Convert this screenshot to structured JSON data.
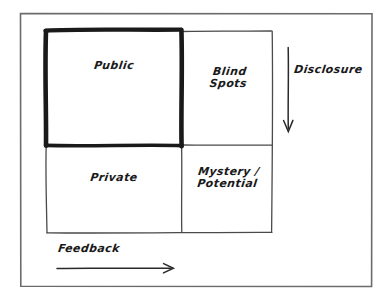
{
  "diagram": {
    "style": "hand-drawn sketch",
    "background_color": "#ffffff",
    "ink_color": "#1a1a1a",
    "frame_color": "#6b6b6b",
    "quadrants": [
      {
        "id": "public",
        "label": "Public",
        "row": "top",
        "col": "left",
        "emphasis": "bold-border"
      },
      {
        "id": "blind",
        "label": "Blind\nSpots",
        "row": "top",
        "col": "right",
        "emphasis": "normal"
      },
      {
        "id": "private",
        "label": "Private",
        "row": "bottom",
        "col": "left",
        "emphasis": "normal"
      },
      {
        "id": "mystery",
        "label": "Mystery /\nPotential",
        "row": "bottom",
        "col": "right",
        "emphasis": "normal"
      }
    ],
    "axes": [
      {
        "id": "disclosure",
        "label": "Disclosure",
        "direction": "down",
        "position": "right"
      },
      {
        "id": "feedback",
        "label": "Feedback",
        "direction": "right",
        "position": "bottom"
      }
    ]
  }
}
